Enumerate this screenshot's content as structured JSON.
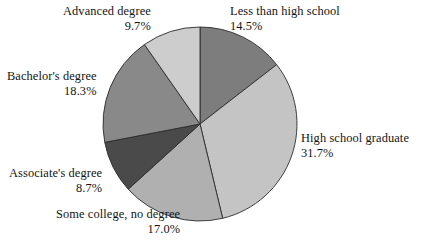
{
  "background_color": "#ffffff",
  "text_color": "#141414",
  "chart_data": {
    "type": "pie",
    "title": "",
    "subtitle": "",
    "xlabel": "",
    "ylabel": "",
    "legend_position": "none",
    "grid": false,
    "labels_outside": true,
    "start_angle_deg": 0,
    "direction": "clockwise",
    "center": {
      "x": 200,
      "y": 124,
      "radius": 97
    },
    "categories": [
      "Less than high school",
      "High school graduate",
      "Some college, no degree",
      "Associate's degree",
      "Bachelor's degree",
      "Advanced degree"
    ],
    "values": [
      14.5,
      31.7,
      17.0,
      8.7,
      18.3,
      9.7
    ],
    "value_labels": [
      "14.5%",
      "31.7%",
      "17.0%",
      "8.7%",
      "18.3%",
      "9.7%"
    ],
    "unit": "%",
    "colors": [
      "#7d7d7d",
      "#c4c4c4",
      "#b0b0b0",
      "#4a4a4a",
      "#898989",
      "#cdcdcd"
    ],
    "slice_border_color": "#2b2b2b",
    "slices": [
      {
        "name": "Less than high school",
        "value": 14.5,
        "value_label": "14.5%",
        "color": "#7d7d7d"
      },
      {
        "name": "High school graduate",
        "value": 31.7,
        "value_label": "31.7%",
        "color": "#c4c4c4"
      },
      {
        "name": "Some college, no degree",
        "value": 17.0,
        "value_label": "17.0%",
        "color": "#b0b0b0"
      },
      {
        "name": "Associate's degree",
        "value": 8.7,
        "value_label": "8.7%",
        "color": "#4a4a4a"
      },
      {
        "name": "Bachelor's degree",
        "value": 18.3,
        "value_label": "18.3%",
        "color": "#898989"
      },
      {
        "name": "Advanced degree",
        "value": 9.7,
        "value_label": "9.7%",
        "color": "#cdcdcd"
      }
    ]
  }
}
